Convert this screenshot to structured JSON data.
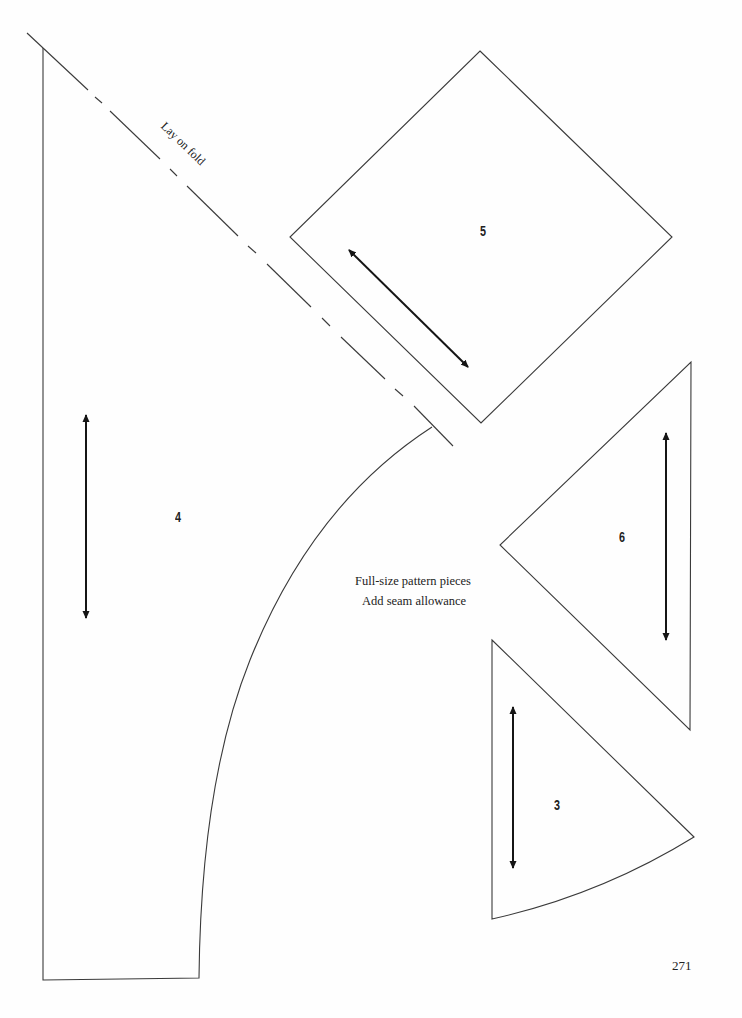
{
  "page": {
    "page_number": "271",
    "notes": {
      "line1": "Full-size pattern pieces",
      "line2": "Add seam allowance"
    },
    "fold_label": "Lay on fold",
    "pieces": [
      {
        "id": "4",
        "label": "4",
        "shape": "curved-sector",
        "grainline": "vertical"
      },
      {
        "id": "5",
        "label": "5",
        "shape": "diamond-square",
        "grainline": "diagonal"
      },
      {
        "id": "6",
        "label": "6",
        "shape": "triangle",
        "grainline": "vertical"
      },
      {
        "id": "3",
        "label": "3",
        "shape": "curved-triangle",
        "grainline": "vertical"
      }
    ]
  }
}
